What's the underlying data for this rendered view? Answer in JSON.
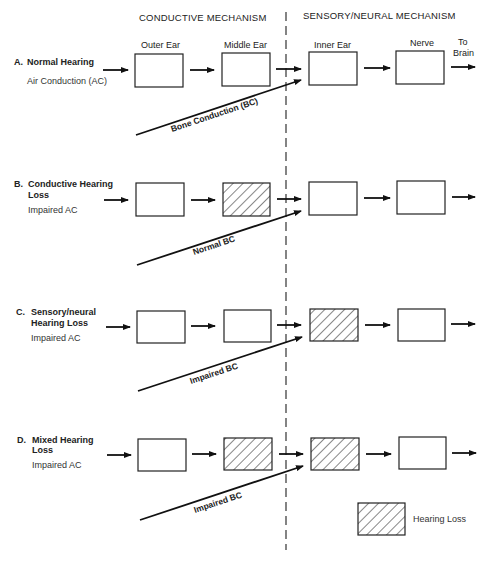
{
  "headers": {
    "conductive": "CONDUCTIVE MECHANISM",
    "sensory": "SENSORY/NEURAL MECHANISM"
  },
  "columns": {
    "outer_ear": "Outer Ear",
    "middle_ear": "Middle Ear",
    "inner_ear": "Inner Ear",
    "nerve": "Nerve",
    "to_brain_1": "To",
    "to_brain_2": "Brain"
  },
  "rows": [
    {
      "letter": "A.",
      "title_1": "Normal Hearing",
      "title_2": "",
      "subtitle": "Air Conduction (AC)",
      "bc_label": "Bone Conduction (BC)",
      "hatched": {
        "outer": false,
        "middle": false,
        "inner": false,
        "nerve": false
      }
    },
    {
      "letter": "B.",
      "title_1": "Conductive Hearing",
      "title_2": "Loss",
      "subtitle": "Impaired AC",
      "bc_label": "Normal BC",
      "hatched": {
        "outer": false,
        "middle": true,
        "inner": false,
        "nerve": false
      }
    },
    {
      "letter": "C.",
      "title_1": "Sensory/neural",
      "title_2": "Hearing Loss",
      "subtitle": "Impaired AC",
      "bc_label": "Impaired BC",
      "hatched": {
        "outer": false,
        "middle": false,
        "inner": true,
        "nerve": false
      }
    },
    {
      "letter": "D.",
      "title_1": "Mixed Hearing",
      "title_2": "Loss",
      "subtitle": "Impaired AC",
      "bc_label": "Impaired BC",
      "hatched": {
        "outer": false,
        "middle": true,
        "inner": true,
        "nerve": false
      }
    }
  ],
  "legend": {
    "label": "Hearing Loss"
  }
}
